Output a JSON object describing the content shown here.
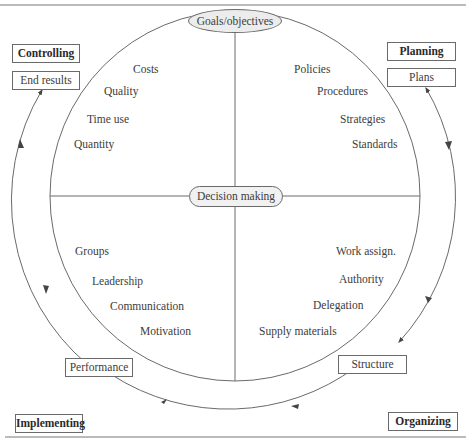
{
  "center": {
    "top_label": "Goals/objectives",
    "middle_label": "Decision making"
  },
  "functions": {
    "planning": "Planning",
    "organizing": "Organizing",
    "implementing": "Implementing",
    "controlling": "Controlling"
  },
  "outputs": {
    "plans": "Plans",
    "structure": "Structure",
    "performance": "Performance",
    "end_results": "End results"
  },
  "quadrants": {
    "controlling": [
      "Costs",
      "Quality",
      "Time use",
      "Quantity"
    ],
    "planning": [
      "Policies",
      "Procedures",
      "Strategies",
      "Standards"
    ],
    "implementing": [
      "Groups",
      "Leadership",
      "Communication",
      "Motivation"
    ],
    "organizing": [
      "Work assign.",
      "Authority",
      "Delegation",
      "Supply materials"
    ]
  },
  "colors": {
    "line": "#6a6a6a",
    "pill_fill": "#ececec",
    "text": "#3c3c3c"
  }
}
